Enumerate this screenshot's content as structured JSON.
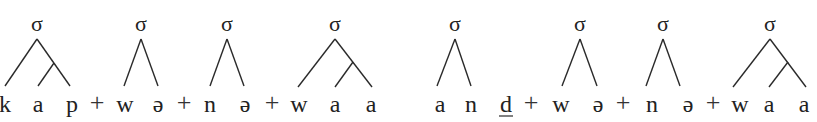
{
  "diagram": {
    "title": "",
    "node_label": "σ",
    "colors": {
      "ink": "#222222",
      "background": "#ffffff"
    },
    "segment_baseline_y": 112,
    "sigma_baseline_y": 31,
    "groups": [
      {
        "name": "kap+wə+nə+waa",
        "segments": [
          {
            "text": "k",
            "x": 5
          },
          {
            "text": "a",
            "x": 38
          },
          {
            "text": "p",
            "x": 72
          },
          {
            "text": "+",
            "x": 97,
            "type": "boundary"
          },
          {
            "text": "w",
            "x": 125
          },
          {
            "text": "ə",
            "x": 158
          },
          {
            "text": "+",
            "x": 184,
            "type": "boundary"
          },
          {
            "text": "n",
            "x": 210
          },
          {
            "text": "ə",
            "x": 245
          },
          {
            "text": "+",
            "x": 272,
            "type": "boundary"
          },
          {
            "text": "w",
            "x": 299
          },
          {
            "text": "a",
            "x": 335
          },
          {
            "text": "a",
            "x": 371
          }
        ],
        "syllables": [
          {
            "sigma_x": 37,
            "apex": [
              37,
              39
            ],
            "branches": [
              [
                5,
                86
              ],
              [
                70,
                86
              ]
            ],
            "inner": {
              "from": [
                54,
                63
              ],
              "to": [
                38,
                86
              ]
            }
          },
          {
            "sigma_x": 141,
            "apex": [
              141,
              39
            ],
            "branches": [
              [
                124,
                86
              ],
              [
                158,
                86
              ]
            ]
          },
          {
            "sigma_x": 227,
            "apex": [
              227,
              39
            ],
            "branches": [
              [
                210,
                86
              ],
              [
                244,
                86
              ]
            ]
          },
          {
            "sigma_x": 335,
            "apex": [
              335,
              39
            ],
            "branches": [
              [
                298,
                87
              ],
              [
                372,
                87
              ]
            ],
            "inner": {
              "from": [
                353,
                62
              ],
              "to": [
                335,
                87
              ]
            }
          }
        ]
      },
      {
        "name": "and̲+wə+nə+waa",
        "segments": [
          {
            "text": "a",
            "x": 440
          },
          {
            "text": "n",
            "x": 471
          },
          {
            "text": "d",
            "x": 506,
            "underline": true
          },
          {
            "text": "+",
            "x": 531,
            "type": "boundary"
          },
          {
            "text": "w",
            "x": 561
          },
          {
            "text": "ə",
            "x": 598
          },
          {
            "text": "+",
            "x": 623,
            "type": "boundary"
          },
          {
            "text": "n",
            "x": 652
          },
          {
            "text": "ə",
            "x": 688
          },
          {
            "text": "+",
            "x": 713,
            "type": "boundary"
          },
          {
            "text": "w",
            "x": 740
          },
          {
            "text": "a",
            "x": 769
          },
          {
            "text": "a",
            "x": 804
          }
        ],
        "syllables": [
          {
            "sigma_x": 455,
            "apex": [
              455,
              39
            ],
            "branches": [
              [
                437,
                86
              ],
              [
                471,
                86
              ]
            ]
          },
          {
            "sigma_x": 580,
            "apex": [
              580,
              39
            ],
            "branches": [
              [
                562,
                86
              ],
              [
                597,
                86
              ]
            ]
          },
          {
            "sigma_x": 663,
            "apex": [
              663,
              39
            ],
            "branches": [
              [
                646,
                86
              ],
              [
                680,
                86
              ]
            ]
          },
          {
            "sigma_x": 770,
            "apex": [
              770,
              39
            ],
            "branches": [
              [
                733,
                87
              ],
              [
                806,
                87
              ]
            ],
            "inner": {
              "from": [
                788,
                62
              ],
              "to": [
                769,
                87
              ]
            }
          }
        ]
      }
    ]
  }
}
